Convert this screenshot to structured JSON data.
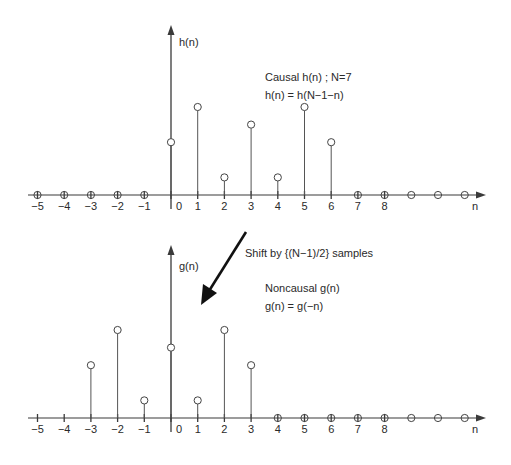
{
  "chart_data": [
    {
      "type": "stem",
      "name": "causal",
      "ylabel": "h(n)",
      "xlabel": "n",
      "annotations": [
        "Causal h(n) ;   N=7",
        "h(n) = h(N−1−n)"
      ],
      "x_ticks": [
        "−5",
        "−4",
        "−3",
        "−2",
        "−1",
        "0",
        "1",
        "2",
        "3",
        "4",
        "5",
        "6",
        "7",
        "8"
      ],
      "x": [
        0,
        1,
        2,
        3,
        4,
        5,
        6
      ],
      "values": [
        3,
        5,
        1,
        4,
        1,
        5,
        3
      ],
      "zero_samples": [
        -5,
        -4,
        -3,
        -2,
        -1,
        7,
        8,
        9,
        10,
        11
      ]
    },
    {
      "type": "stem",
      "name": "noncausal",
      "ylabel": "g(n)",
      "xlabel": "n",
      "annotations": [
        "Noncausal g(n)",
        "g(n) = g(−n)"
      ],
      "x_ticks": [
        "−5",
        "−4",
        "−3",
        "−2",
        "−1",
        "0",
        "1",
        "2",
        "3",
        "4",
        "5",
        "6",
        "7",
        "8"
      ],
      "x": [
        -3,
        -2,
        -1,
        0,
        1,
        2,
        3
      ],
      "values": [
        3,
        5,
        1,
        4,
        1,
        5,
        3
      ],
      "zero_samples": [
        4,
        5,
        6,
        7,
        8,
        9,
        10,
        11
      ]
    }
  ],
  "arrow_label": "Shift by {(N−1)/2} samples",
  "colors": {
    "axis": "#3a3a3a",
    "stem": "#555555",
    "marker": "#444444",
    "arrow": "#111111"
  }
}
